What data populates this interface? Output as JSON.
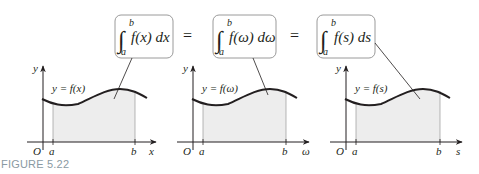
{
  "figure": {
    "caption": "FIGURE 5.22",
    "equation": {
      "equals_sign": "=",
      "integrals": [
        {
          "lower": "a",
          "upper": "b",
          "integrand": "f(x) dx",
          "box_x": 115
        },
        {
          "lower": "a",
          "upper": "b",
          "integrand": "f(ω) dω",
          "box_x": 212
        },
        {
          "lower": "a",
          "upper": "b",
          "integrand": "f(s) ds",
          "box_x": 317
        }
      ]
    },
    "panels": [
      {
        "y_label": "y",
        "curve_label": "y = f(x)",
        "origin_label": "O",
        "a_label": "a",
        "b_label": "b",
        "x_label": "x"
      },
      {
        "y_label": "y",
        "curve_label": "y = f(ω)",
        "origin_label": "O",
        "a_label": "a",
        "b_label": "b",
        "x_label": "ω"
      },
      {
        "y_label": "y",
        "curve_label": "y = f(s)",
        "origin_label": "O",
        "a_label": "a",
        "b_label": "b",
        "x_label": "s"
      }
    ],
    "colors": {
      "shade": "#ededed",
      "box_border": "#9a9a9a",
      "ink": "#231f20",
      "caption": "#8a9aa3"
    }
  }
}
